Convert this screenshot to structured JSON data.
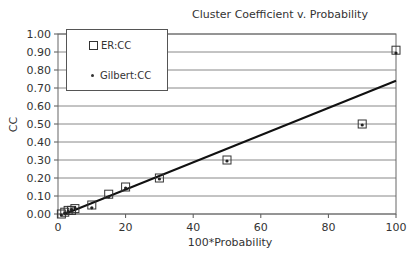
{
  "chart_data": {
    "type": "scatter",
    "title": "Cluster Coefficient v. Probability",
    "xlabel": "100*Probability",
    "ylabel": "CC",
    "xlim": [
      0,
      100
    ],
    "ylim": [
      0,
      1.0
    ],
    "xticks": [
      "0",
      "20",
      "40",
      "60",
      "80",
      "100"
    ],
    "yticks": [
      "0.00",
      "0.10",
      "0.20",
      "0.30",
      "0.40",
      "0.50",
      "0.60",
      "0.70",
      "0.80",
      "0.90",
      "1.00"
    ],
    "grid": true,
    "legend_position": "upper-left",
    "series": [
      {
        "name": "ER:CC",
        "marker": "open-square",
        "x": [
          1,
          2,
          3,
          4,
          5,
          10,
          15,
          20,
          30,
          50,
          90,
          100
        ],
        "y": [
          0.0,
          0.01,
          0.02,
          0.02,
          0.03,
          0.05,
          0.11,
          0.15,
          0.2,
          0.3,
          0.5,
          0.91
        ]
      },
      {
        "name": "Gilbert:CC",
        "marker": "dot",
        "x": [
          1,
          2,
          3,
          4,
          5,
          10,
          15,
          20,
          30,
          50,
          90,
          100
        ],
        "y": [
          0.0,
          0.01,
          0.02,
          0.03,
          0.04,
          0.04,
          0.1,
          0.15,
          0.2,
          0.3,
          0.5,
          0.9
        ]
      },
      {
        "name": "Linear trend",
        "marker": "line",
        "x": [
          2,
          100
        ],
        "y": [
          0.0,
          0.74
        ]
      }
    ]
  }
}
